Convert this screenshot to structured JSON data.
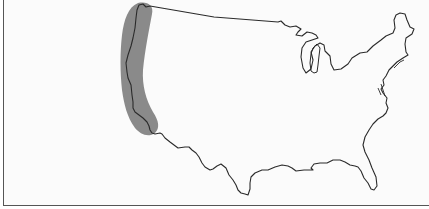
{
  "map": {
    "title": "Contiguous United States outline with highlighted West Coast region",
    "region_highlighted": "Pacific coast (Washington, Oregon, California)",
    "colors": {
      "outline": "#2a2a2a",
      "highlight": "#8a8a8a",
      "background": "#fbfbfb",
      "frame": "#555555"
    }
  }
}
